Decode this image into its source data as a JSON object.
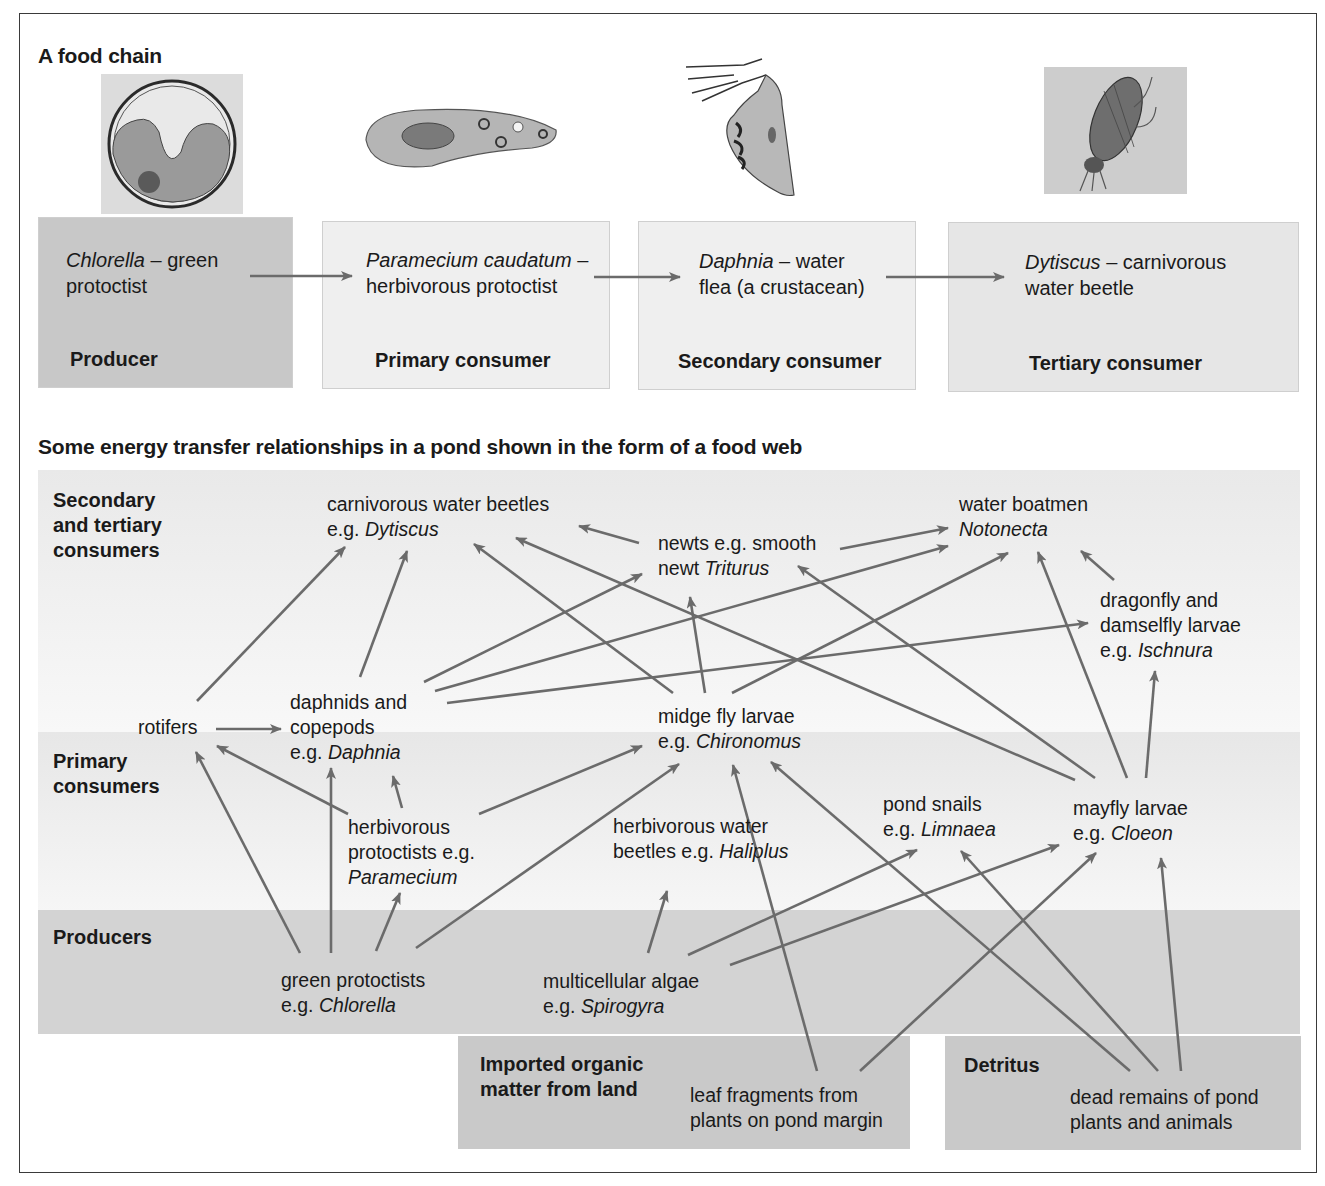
{
  "food_chain": {
    "title": "A food chain",
    "arrow_color": "#6b6b6b",
    "steps": [
      {
        "organism_italic": "Chlorella",
        "organism_rest": " – green",
        "line2": "protoctist",
        "role": "Producer",
        "bg": "#c8c8c8",
        "image": "chlorella-cell-illustration"
      },
      {
        "organism_italic": "Paramecium caudatum",
        "organism_rest": " –",
        "line2": "herbivorous protoctist",
        "role": "Primary consumer",
        "bg": "#efefef",
        "image": "paramecium-illustration"
      },
      {
        "organism_italic": "Daphnia",
        "organism_rest": " – water",
        "line2": "flea (a crustacean)",
        "role": "Secondary consumer",
        "bg": "#efefef",
        "image": "daphnia-illustration"
      },
      {
        "organism_italic": "Dytiscus",
        "organism_rest": " – carnivorous",
        "line2": "water beetle",
        "role": "Tertiary consumer",
        "bg": "#e6e6e6",
        "image": "dytiscus-beetle-illustration"
      }
    ]
  },
  "food_web": {
    "title": "Some energy transfer relationships in a pond shown in the form of a food web",
    "levels": {
      "secondary_tertiary": [
        "Secondary",
        "and tertiary",
        "consumers"
      ],
      "primary": [
        "Primary",
        "consumers"
      ],
      "producers": [
        "Producers"
      ],
      "imported": [
        "Imported organic",
        "matter from land"
      ],
      "detritus": [
        "Detritus"
      ]
    },
    "nodes": {
      "beetles": {
        "l1": "carnivorous water beetles",
        "pre": "e.g. ",
        "it": "Dytiscus"
      },
      "newts": {
        "l1": "newts e.g. smooth",
        "pre": "newt ",
        "it": "Triturus"
      },
      "boatmen": {
        "l1": "water boatmen",
        "pre": "",
        "it": "Notonecta"
      },
      "dragonfly": {
        "l1": "dragonfly and",
        "l2": "damselfly larvae",
        "pre": "e.g. ",
        "it": "Ischnura"
      },
      "rotifers": {
        "l1": "rotifers"
      },
      "daphnids": {
        "l1": "daphnids and",
        "l2": "copepods",
        "pre": "e.g. ",
        "it": "Daphnia"
      },
      "midge": {
        "l1": "midge fly larvae",
        "pre": "e.g. ",
        "it": "Chironomus"
      },
      "herb_protoctists": {
        "l1": "herbivorous",
        "l2": "protoctists e.g.",
        "pre": "",
        "it": "Paramecium"
      },
      "herb_beetles": {
        "l1": "herbivorous water",
        "pre": "beetles e.g. ",
        "it": "Haliplus"
      },
      "snails": {
        "l1": "pond snails",
        "pre": "e.g. ",
        "it": "Limnaea"
      },
      "mayfly": {
        "l1": "mayfly larvae",
        "pre": "e.g. ",
        "it": "Cloeon"
      },
      "green_protoctists": {
        "l1": "green protoctists",
        "pre": "e.g. ",
        "it": "Chlorella"
      },
      "algae": {
        "l1": "multicellular algae",
        "pre": "e.g. ",
        "it": "Spirogyra"
      },
      "leaf": {
        "l1": "leaf fragments from",
        "l2": "plants on pond margin"
      },
      "dead": {
        "l1": "dead remains of pond",
        "l2": "plants and animals"
      }
    },
    "edges": [
      [
        "rotifers",
        "carnivorous water beetles"
      ],
      [
        "rotifers",
        "daphnids and copepods"
      ],
      [
        "daphnids and copepods",
        "carnivorous water beetles"
      ],
      [
        "daphnids and copepods",
        "newts"
      ],
      [
        "daphnids and copepods",
        "water boatmen"
      ],
      [
        "daphnids and copepods",
        "dragonfly and damselfly larvae"
      ],
      [
        "newts",
        "carnivorous water beetles"
      ],
      [
        "newts",
        "water boatmen"
      ],
      [
        "dragonfly and damselfly larvae",
        "water boatmen"
      ],
      [
        "midge fly larvae",
        "carnivorous water beetles"
      ],
      [
        "midge fly larvae",
        "newts"
      ],
      [
        "midge fly larvae",
        "water boatmen"
      ],
      [
        "mayfly larvae",
        "carnivorous water beetles"
      ],
      [
        "mayfly larvae",
        "newts"
      ],
      [
        "mayfly larvae",
        "water boatmen"
      ],
      [
        "mayfly larvae",
        "dragonfly and damselfly larvae"
      ],
      [
        "herbivorous protoctists",
        "rotifers"
      ],
      [
        "herbivorous protoctists",
        "daphnids and copepods"
      ],
      [
        "herbivorous protoctists",
        "midge fly larvae"
      ],
      [
        "green protoctists",
        "rotifers"
      ],
      [
        "green protoctists",
        "daphnids and copepods"
      ],
      [
        "green protoctists",
        "herbivorous protoctists"
      ],
      [
        "green protoctists",
        "midge fly larvae"
      ],
      [
        "multicellular algae",
        "herbivorous water beetles"
      ],
      [
        "multicellular algae",
        "pond snails"
      ],
      [
        "multicellular algae",
        "mayfly larvae"
      ],
      [
        "leaf fragments",
        "midge fly larvae"
      ],
      [
        "leaf fragments",
        "mayfly larvae"
      ],
      [
        "dead remains",
        "midge fly larvae"
      ],
      [
        "dead remains",
        "pond snails"
      ],
      [
        "dead remains",
        "mayfly larvae"
      ]
    ]
  }
}
